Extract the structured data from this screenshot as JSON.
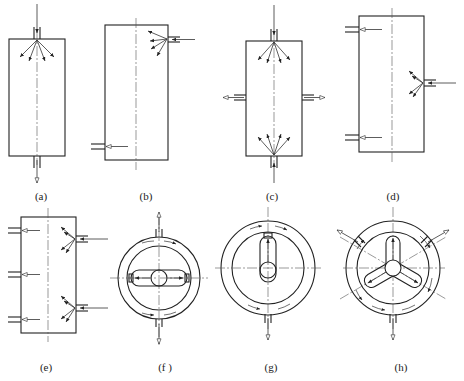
{
  "figure": {
    "panels": [
      {
        "id": "a",
        "label": "(a)",
        "shape": "rectangle",
        "inlets": [
          "top-center"
        ],
        "outlets": [
          "bottom-center"
        ]
      },
      {
        "id": "b",
        "label": "(b)",
        "shape": "rectangle",
        "inlets": [
          "right-upper"
        ],
        "outlets": [
          "left-lower"
        ]
      },
      {
        "id": "c",
        "label": "(c)",
        "shape": "rectangle",
        "inlets": [
          "top-center",
          "bottom-center"
        ],
        "outlets": [
          "left-middle",
          "right-middle"
        ]
      },
      {
        "id": "d",
        "label": "(d)",
        "shape": "rectangle",
        "inlets": [
          "right-middle"
        ],
        "outlets": [
          "left-upper",
          "left-lower"
        ]
      },
      {
        "id": "e",
        "label": "(e)",
        "shape": "rectangle",
        "inlets": [
          "right-upper",
          "right-lower"
        ],
        "outlets": [
          "left-upper",
          "left-middle",
          "left-lower"
        ]
      },
      {
        "id": "f",
        "label": "(f )",
        "shape": "annular-circle",
        "inner": "horizontal slot with center hub",
        "outlets": [
          "top",
          "bottom"
        ]
      },
      {
        "id": "g",
        "label": "(g)",
        "shape": "annular-circle",
        "inner": "vertical slot with hub",
        "outlets": [
          "bottom"
        ]
      },
      {
        "id": "h",
        "label": "(h)",
        "shape": "annular-circle",
        "inner": "three-arm star with hub",
        "outlets": [
          "upper-left",
          "upper-right",
          "bottom"
        ]
      }
    ]
  },
  "labels": {
    "a": "(a)",
    "b": "(b)",
    "c": "(c)",
    "d": "(d)",
    "e": "(e)",
    "f": "(f )",
    "g": "(g)",
    "h": "(h)"
  }
}
